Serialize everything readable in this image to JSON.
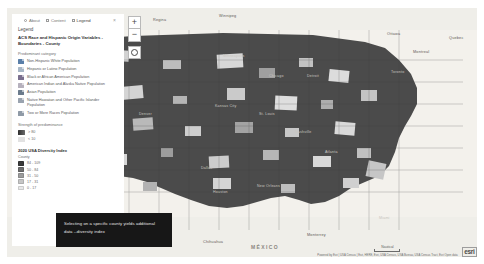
{
  "app": {
    "title": "ArcGIS Map Viewer"
  },
  "panel": {
    "tabs": [
      {
        "label": "About",
        "icon": "info-circle-icon",
        "active": false
      },
      {
        "label": "Content",
        "icon": "layers-icon",
        "active": false
      },
      {
        "label": "Legend",
        "icon": "legend-icon",
        "active": true
      }
    ],
    "close_label": "×",
    "heading": "Legend",
    "layer_title": "ACS Race and Hispanic Origin Variables - Boundaries - County",
    "predominant_label": "Predominant category",
    "categories": [
      {
        "label": "Non-Hispanic White Population",
        "color": "#5a7fa8"
      },
      {
        "label": "Hispanic or Latino Population",
        "color": "#a8b7c6"
      },
      {
        "label": "Black or African American Population",
        "color": "#7a6f8e"
      },
      {
        "label": "American Indian and Alaska Native Population",
        "color": "#b6b1bd"
      },
      {
        "label": "Asian Population",
        "color": "#6b7b8c"
      },
      {
        "label": "Native Hawaiian and Other Pacific Islander Population",
        "color": "#9aa3af"
      },
      {
        "label": "Two or More Races Population",
        "color": "#8f9aa6"
      }
    ],
    "strength_label": "Strength of predominance",
    "strength_items": [
      {
        "value": "> 80",
        "color": "#3d3d3d"
      },
      {
        "value": "< 10",
        "color": "#d6d6d6"
      }
    ],
    "diversity_title": "2020 USA Diversity Index",
    "diversity_sub": "County",
    "diversity_breaks": [
      {
        "range": "84 - 109",
        "color": "#3a3a3a"
      },
      {
        "range": "50 - 84",
        "color": "#6e6e6e"
      },
      {
        "range": "31 - 50",
        "color": "#9c9c9c"
      },
      {
        "range": "17 - 31",
        "color": "#c6c6c6"
      },
      {
        "range": "0 - 17",
        "color": "#e8e8e8"
      }
    ]
  },
  "map_controls": {
    "zoom_in": "+",
    "zoom_out": "−",
    "home_label": "home"
  },
  "callout": {
    "text": "Selecting on a specific county yields additional data --diversity index"
  },
  "map_labels": {
    "canada_cities": [
      "Calgary",
      "Regina",
      "Winnipeg",
      "Ottawa",
      "Montreal",
      "Toronto",
      "Quebec"
    ],
    "usa_cities": [
      "Seattle",
      "Portland",
      "Boise",
      "Salt Lake City",
      "Denver",
      "Minneapolis",
      "Chicago",
      "Detroit",
      "Kansas City",
      "St. Louis",
      "Nashville",
      "Atlanta",
      "Dallas",
      "Houston",
      "New Orleans",
      "Miami",
      "Las Vegas",
      "Phoenix",
      "San Diego"
    ],
    "mexico_cities": [
      "Monterrey",
      "Chihuahua",
      "Hermosillo"
    ],
    "countries": [
      "MÉXICO"
    ]
  },
  "attribution": {
    "scale_label": "Nautical",
    "text": "Powered by Esri | USA Census | Esri, HERE, Esri, USA Census, USA Bureau, USA Census Tract, Esri Open data",
    "logo": "esri"
  }
}
